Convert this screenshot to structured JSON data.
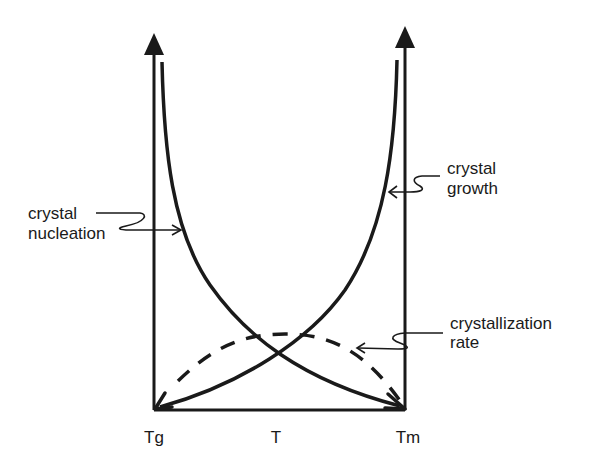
{
  "diagram": {
    "type": "rate-vs-temperature schematic",
    "x_axis": {
      "ticks": [
        {
          "label": "Tg"
        },
        {
          "label": "T"
        },
        {
          "label": "Tm"
        }
      ]
    },
    "curves": [
      {
        "id": "nucleation",
        "label_lines": [
          "crystal",
          "nucleation"
        ],
        "style": "solid"
      },
      {
        "id": "growth",
        "label_lines": [
          "crystal",
          "growth"
        ],
        "style": "solid"
      },
      {
        "id": "crystallization",
        "label_lines": [
          "crystallization",
          "rate"
        ],
        "style": "dashed"
      }
    ],
    "colors": {
      "ink": "#1a1a1a",
      "background": "#ffffff"
    }
  }
}
